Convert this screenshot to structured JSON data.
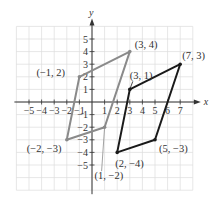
{
  "axes": {
    "x_label": "x",
    "y_label": "y",
    "x_ticks": [
      -5,
      -4,
      -3,
      -2,
      -1,
      1,
      2,
      3,
      4,
      5,
      6,
      7
    ],
    "y_ticks": [
      5,
      4,
      3,
      2,
      1,
      -1,
      -2,
      -3,
      -4,
      -5
    ],
    "grid_x_range": [
      -6,
      8
    ],
    "grid_y_range": [
      -7,
      6
    ]
  },
  "shapes": [
    {
      "name": "parallelogram-gray",
      "color": "#8a8a8a",
      "vertices": [
        [
          -1,
          2
        ],
        [
          3,
          4
        ],
        [
          1,
          -2
        ],
        [
          -2,
          -3
        ]
      ],
      "labels": [
        "(−1, 2)",
        "(3, 4)",
        "(1, −2)",
        "(−2, −3)"
      ]
    },
    {
      "name": "parallelogram-black",
      "color": "#1a1a1a",
      "vertices": [
        [
          3,
          1
        ],
        [
          7,
          3
        ],
        [
          5,
          -3
        ],
        [
          2,
          -4
        ]
      ],
      "labels": [
        "(3, 1)",
        "(7, 3)",
        "(5, −3)",
        "(2, −4)"
      ]
    }
  ],
  "grid_color": "#dcdcdc",
  "axis_color": "#333333"
}
